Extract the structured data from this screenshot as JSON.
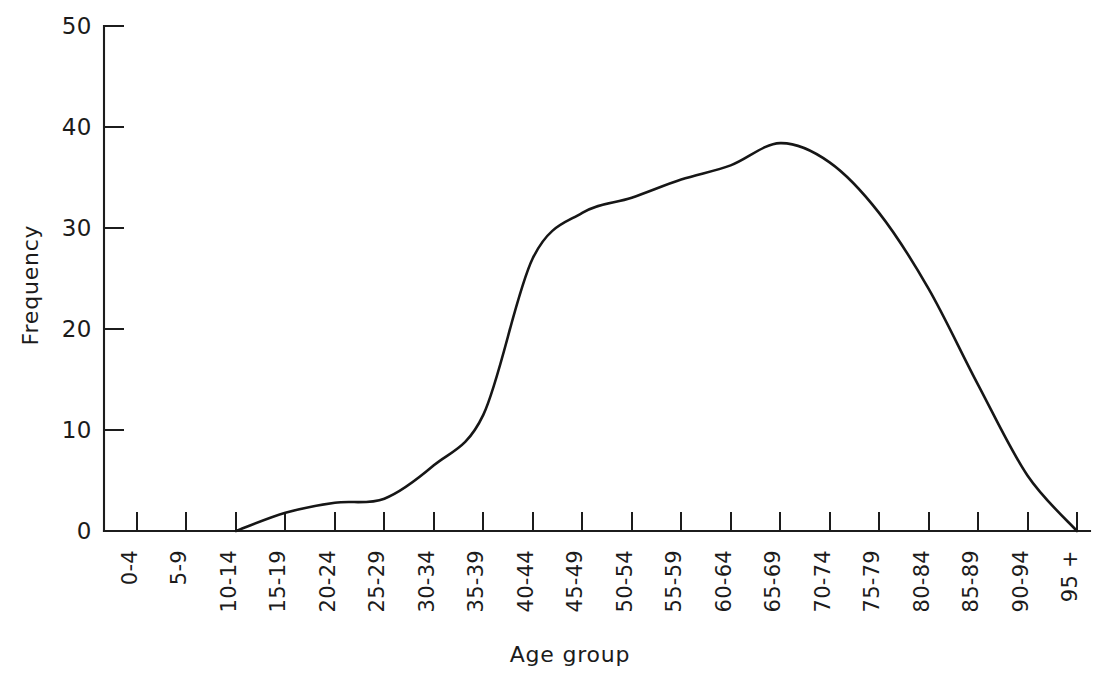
{
  "chart_data": {
    "type": "line",
    "title": "",
    "xlabel": "Age group",
    "ylabel": "Frequency",
    "categories": [
      "0-4",
      "5-9",
      "10-14",
      "15-19",
      "20-24",
      "25-29",
      "30-34",
      "35-39",
      "40-44",
      "45-49",
      "50-54",
      "55-59",
      "60-64",
      "65-69",
      "70-74",
      "75-79",
      "80-84",
      "85-89",
      "90-94",
      "95 +"
    ],
    "values": [
      0,
      0,
      0,
      1.8,
      2.8,
      3.2,
      6.5,
      11.5,
      27.0,
      31.5,
      33.0,
      34.8,
      36.2,
      38.4,
      36.5,
      31.5,
      24.0,
      14.5,
      5.5,
      0
    ],
    "ylim": [
      0,
      50
    ],
    "yticks": [
      0,
      10,
      20,
      30,
      40,
      50
    ],
    "ytick_labels": [
      "0",
      "10",
      "20",
      "30",
      "40",
      "50"
    ],
    "grid": false,
    "legend": null,
    "xtick_rotation": 90,
    "curve_style": "smooth-frequency-polygon",
    "line_color": "#161616",
    "axis_color": "#1c1c1c",
    "background_color": "#ffffff"
  },
  "axes": {
    "y_title": "Frequency",
    "x_title": "Age group",
    "y_tick_labels": [
      "50",
      "40",
      "30",
      "20",
      "10",
      "0"
    ],
    "x_tick_labels": [
      "0-4",
      "5-9",
      "10-14",
      "15-19",
      "20-24",
      "25-29",
      "30-34",
      "35-39",
      "40-44",
      "45-49",
      "50-54",
      "55-59",
      "60-64",
      "65-69",
      "70-74",
      "75-79",
      "80-84",
      "85-89",
      "90-94",
      "95 +"
    ]
  },
  "caption": {
    "text": ""
  }
}
